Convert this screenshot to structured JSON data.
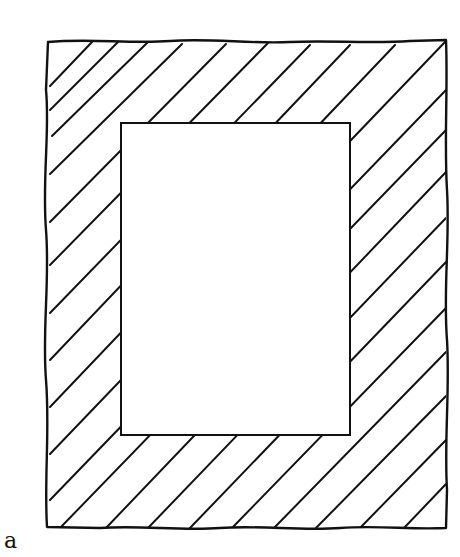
{
  "figure": {
    "label": "a",
    "colors": {
      "ink": "#111111",
      "background": "#ffffff",
      "inner_fill": "#ffffff"
    },
    "outer_rect": {
      "x": 46,
      "y": 40,
      "width": 400,
      "height": 489
    },
    "inner_rect": {
      "x": 121,
      "y": 123,
      "width": 229,
      "height": 312
    },
    "hatching": {
      "direction": "lower-left to upper-right",
      "angle_deg": 40,
      "spacing_px": 40
    }
  }
}
